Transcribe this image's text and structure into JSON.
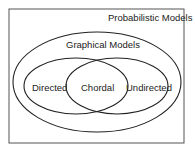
{
  "diagram": {
    "type": "venn",
    "outer_set": {
      "label": "Probabilistic Models"
    },
    "middle_set": {
      "label": "Graphical Models"
    },
    "inner_sets": [
      {
        "label": "Directed"
      },
      {
        "label": "Chordal"
      },
      {
        "label": "Undirected"
      }
    ],
    "colors": {
      "stroke": "#222222",
      "border": "#444444",
      "background": "#ffffff"
    }
  }
}
